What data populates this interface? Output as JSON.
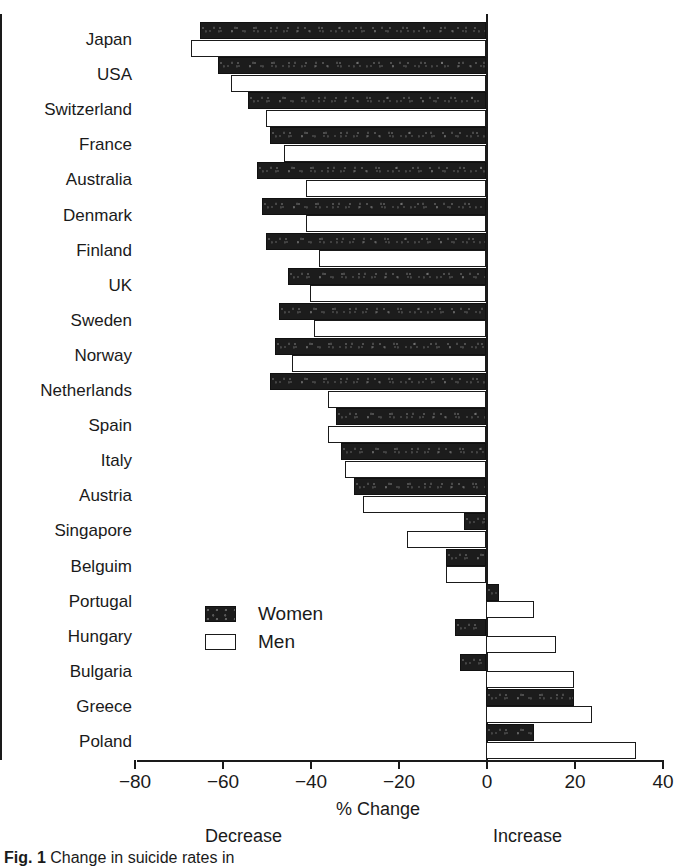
{
  "chart_data": {
    "type": "bar",
    "orientation": "horizontal",
    "title": "",
    "xlabel": "% Change",
    "ylabel": "",
    "xlim": [
      -80,
      40
    ],
    "xticks": [
      -80,
      -60,
      -40,
      -20,
      0,
      20,
      40
    ],
    "xtick_labels": [
      "−80",
      "−60",
      "−40",
      "−20",
      "0",
      "20",
      "40"
    ],
    "grid": false,
    "legend_position": "inside-lower-left",
    "annotations": [
      "Decrease",
      "Increase"
    ],
    "categories": [
      "Japan",
      "USA",
      "Switzerland",
      "France",
      "Australia",
      "Denmark",
      "Finland",
      "UK",
      "Sweden",
      "Norway",
      "Netherlands",
      "Spain",
      "Italy",
      "Austria",
      "Singapore",
      "Belguim",
      "Portugal",
      "Hungary",
      "Bulgaria",
      "Greece",
      "Poland"
    ],
    "series": [
      {
        "name": "Women",
        "color": "#1c1c1c",
        "values": [
          -65,
          -61,
          -54,
          -49,
          -52,
          -51,
          -50,
          -45,
          -47,
          -48,
          -49,
          -34,
          -33,
          -30,
          -5,
          -9,
          3,
          -7,
          -6,
          20,
          11
        ]
      },
      {
        "name": "Men",
        "color": "#ffffff",
        "values": [
          -67,
          -58,
          -50,
          -46,
          -41,
          -41,
          -38,
          -40,
          -39,
          -44,
          -36,
          -36,
          -32,
          -28,
          -18,
          -9,
          11,
          16,
          20,
          24,
          34
        ]
      }
    ]
  },
  "legend": {
    "items": [
      {
        "label": "Women",
        "swatch": "filled-black-square"
      },
      {
        "label": "Men",
        "swatch": "open-white-square"
      }
    ]
  },
  "axis": {
    "x_title": "% Change",
    "decrease_label": "Decrease",
    "increase_label": "Increase"
  },
  "caption": {
    "figure_number": "Fig. 1",
    "text": "Change in suicide rates in"
  }
}
